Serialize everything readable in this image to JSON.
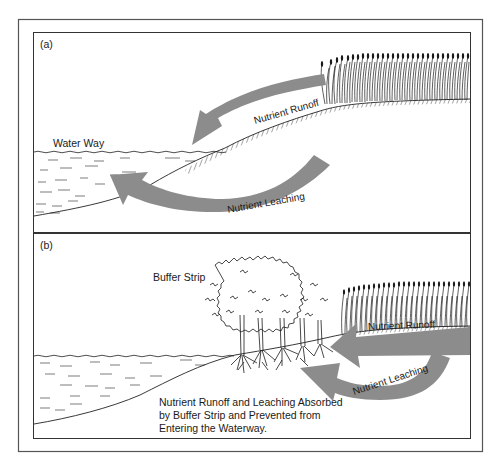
{
  "figure": {
    "panels": [
      {
        "id": "a",
        "label": "(a)",
        "waterway_label": "Water Way",
        "arrows": [
          {
            "label": "Nutrient Runoff",
            "direction": "from crop field toward waterway over surface"
          },
          {
            "label": "Nutrient Leaching",
            "direction": "from under crop field through soil into waterway"
          }
        ]
      },
      {
        "id": "b",
        "label": "(b)",
        "buffer_label": "Buffer Strip",
        "arrows": [
          {
            "label": "Nutrient Runoff",
            "direction": "from crop field toward buffer strip"
          },
          {
            "label": "Nutrient Leaching",
            "direction": "from under crop field toward buffer strip roots"
          }
        ],
        "caption_lines": [
          "Nutrient Runoff and Leaching Absorbed",
          "by Buffer Strip and Prevented from",
          "Entering the Waterway."
        ]
      }
    ],
    "colors": {
      "arrow": "#8c8c8c",
      "line": "#1a1a1a",
      "frame": "#555555",
      "background": "#ffffff"
    }
  }
}
